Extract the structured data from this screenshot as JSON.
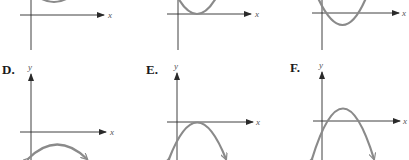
{
  "panels": [
    {
      "id": "A",
      "label": "",
      "x_axis_label": "x",
      "y_axis_label": "",
      "shape": "upward parabola, vertex above x-axis, no x-intercepts"
    },
    {
      "id": "B",
      "label": "",
      "x_axis_label": "x",
      "y_axis_label": "",
      "shape": "upward parabola, vertex on x-axis, one x-intercept"
    },
    {
      "id": "C",
      "label": "",
      "x_axis_label": "x",
      "y_axis_label": "",
      "shape": "upward parabola, vertex below x-axis, two x-intercepts"
    },
    {
      "id": "D",
      "label": "D.",
      "x_axis_label": "x",
      "y_axis_label": "y",
      "shape": "downward parabola, vertex below x-axis, no x-intercepts"
    },
    {
      "id": "E",
      "label": "E.",
      "x_axis_label": "x",
      "y_axis_label": "y",
      "shape": "downward parabola, vertex on x-axis, one x-intercept"
    },
    {
      "id": "F",
      "label": "F.",
      "x_axis_label": "x",
      "y_axis_label": "y",
      "shape": "downward parabola, vertex above x-axis, two x-intercepts"
    }
  ],
  "colors": {
    "axis": "#2a2a2a",
    "curve": "#8a8a8a"
  }
}
